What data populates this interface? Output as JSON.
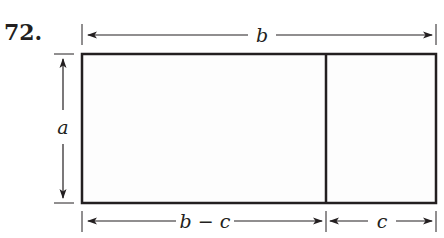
{
  "problem_number": "72.",
  "labels": {
    "top_width": "b",
    "height": "a",
    "bottom_left": "b − c",
    "bottom_right": "c"
  },
  "colors": {
    "stroke": "#231f20",
    "fill": "#fdfdfd"
  }
}
